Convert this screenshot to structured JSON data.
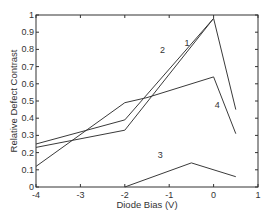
{
  "chart_data": {
    "type": "line",
    "title": "",
    "xlabel": "Diode Bias (V)",
    "ylabel": "Relative Defect Contrast",
    "xlim": [
      -4,
      1
    ],
    "ylim": [
      0,
      1
    ],
    "xticks": [
      -4,
      -3,
      -2,
      -1,
      0,
      1
    ],
    "yticks": [
      0,
      0.1,
      0.2,
      0.3,
      0.4,
      0.5,
      0.6,
      0.7,
      0.8,
      0.9,
      1
    ],
    "grid": false,
    "legend": "none (inline curve labels)",
    "series": [
      {
        "name": "1",
        "x": [
          -4,
          -2,
          0,
          0.5
        ],
        "y": [
          0.23,
          0.33,
          0.98,
          0.45
        ],
        "label_pos": [
          -0.6,
          0.82
        ]
      },
      {
        "name": "2",
        "x": [
          -4,
          -2,
          0
        ],
        "y": [
          0.25,
          0.39,
          0.98
        ],
        "label_pos": [
          -1.15,
          0.78
        ]
      },
      {
        "name": "3",
        "x": [
          -2,
          -0.5,
          0.5
        ],
        "y": [
          0.0,
          0.14,
          0.06
        ],
        "label_pos": [
          -1.2,
          0.17
        ]
      },
      {
        "name": "4",
        "x": [
          -4,
          -2,
          -1.5,
          0,
          0.5
        ],
        "y": [
          0.12,
          0.49,
          0.52,
          0.64,
          0.31
        ],
        "label_pos": [
          0.08,
          0.46
        ]
      }
    ]
  },
  "axes": {
    "xlabel": "Diode Bias (V)",
    "ylabel": "Relative Defect Contrast",
    "xtick_labels": [
      "-4",
      "-3",
      "-2",
      "-1",
      "0",
      "1"
    ],
    "ytick_labels": [
      "0",
      "0.1",
      "0.2",
      "0.3",
      "0.4",
      "0.5",
      "0.6",
      "0.7",
      "0.8",
      "0.9",
      "1"
    ]
  },
  "colors": {
    "line": "#3a3a3a",
    "axis": "#333333",
    "background": "#ffffff"
  }
}
